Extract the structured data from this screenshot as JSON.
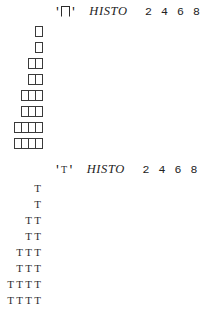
{
  "page": {
    "background_color": "#ffffff",
    "text_color": "#1a1a1a"
  },
  "histograms": [
    {
      "id": "histogram-boxes",
      "symbol_name": "box-glyph",
      "symbol_char": "⌷",
      "quote_open": "'",
      "quote_close": "'",
      "title": "HISTO",
      "tick_labels": [
        "2",
        "4",
        "6",
        "8"
      ],
      "mark_style": "box",
      "counts": [
        1,
        1,
        2,
        2,
        3,
        3,
        4,
        4
      ]
    },
    {
      "id": "histogram-tees",
      "symbol_name": "tee-glyph",
      "symbol_char": "T",
      "quote_open": "'",
      "quote_close": "'",
      "title": "HISTO",
      "tick_labels": [
        "2",
        "4",
        "6",
        "8"
      ],
      "mark_style": "tee",
      "mark_char": "T",
      "counts": [
        1,
        1,
        2,
        2,
        3,
        3,
        4,
        4
      ]
    }
  ],
  "chart_data": {
    "type": "bar",
    "title": "HISTO",
    "orientation": "horizontal",
    "xlabel": "",
    "ylabel": "",
    "categories": [
      "1",
      "2",
      "3",
      "4",
      "5",
      "6",
      "7",
      "8"
    ],
    "values": [
      1,
      1,
      2,
      2,
      3,
      3,
      4,
      4
    ],
    "tick_labels": [
      "2",
      "4",
      "6",
      "8"
    ],
    "xlim": [
      0,
      8
    ],
    "grid": false,
    "legend": null,
    "series": [
      {
        "name": "'⌷' HISTO",
        "values": [
          1,
          1,
          2,
          2,
          3,
          3,
          4,
          4
        ]
      },
      {
        "name": "'T' HISTO",
        "values": [
          1,
          1,
          2,
          2,
          3,
          3,
          4,
          4
        ]
      }
    ]
  }
}
